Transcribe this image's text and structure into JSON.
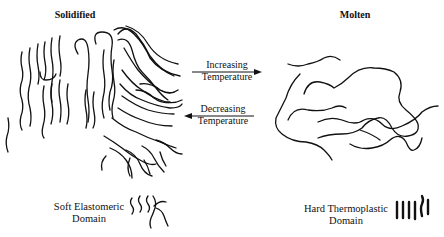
{
  "diagram": {
    "left_panel": {
      "title": "Solidified"
    },
    "right_panel": {
      "title": "Molten"
    },
    "arrows": [
      {
        "direction": "right",
        "line1": "Increasing",
        "line2": "Temperature"
      },
      {
        "direction": "left",
        "line1": "Decreasing",
        "line2": "Temperature"
      }
    ],
    "legend": [
      {
        "line1": "Soft Elastomeric",
        "line2": "Domain",
        "symbol": "wavy-chains"
      },
      {
        "line1": "Hard Thermoplastic",
        "line2": "Domain",
        "symbol": "rigid-segments"
      }
    ],
    "colors": {
      "ink": "#111111",
      "background": "#ffffff"
    }
  }
}
